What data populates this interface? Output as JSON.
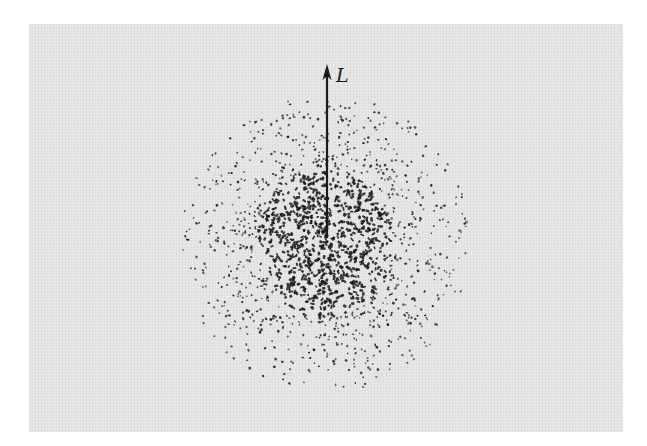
{
  "figure": {
    "arrow_label": "L",
    "colors": {
      "panel_background": "#e4e4e4",
      "page_background": "#ffffff",
      "ink": "#1a1a1a"
    },
    "arrow": {
      "x": 327,
      "y_tail": 238,
      "y_tip": 64
    },
    "label_position": {
      "x": 336,
      "y": 66
    },
    "cloud": {
      "center_x": 325,
      "center_y": 243,
      "sigma_x": 62,
      "sigma_y": 68,
      "max_radius_x": 145,
      "max_radius_y": 150,
      "point_count": 1700,
      "seed": 12345
    }
  }
}
